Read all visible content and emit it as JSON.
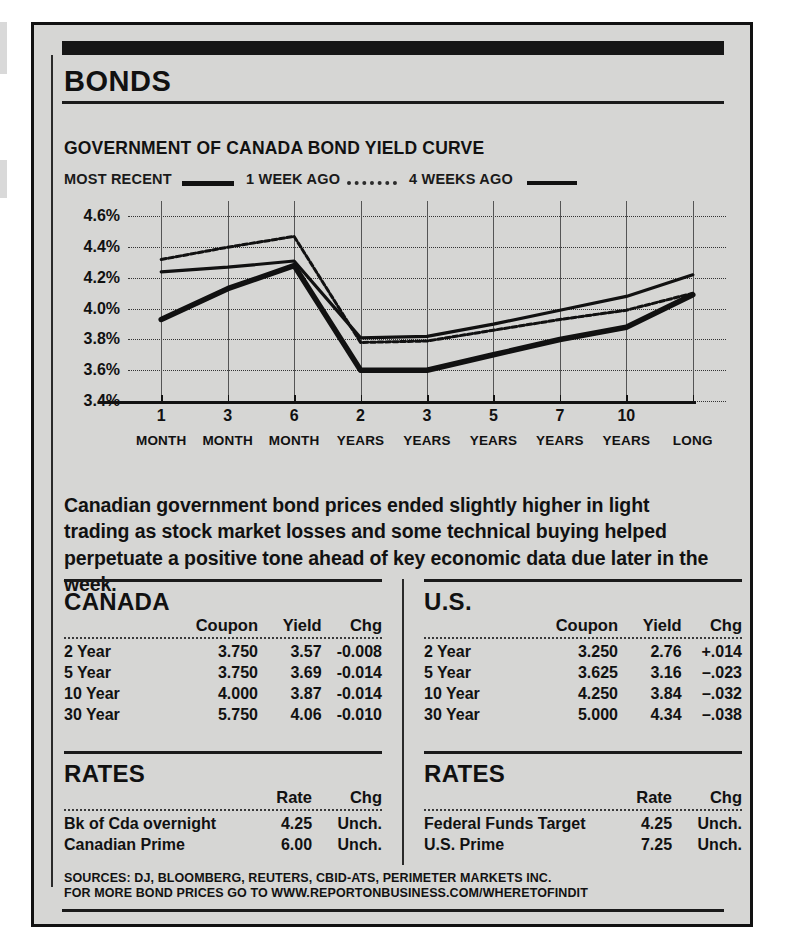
{
  "panel": {
    "title": "BONDS",
    "subtitle": "GOVERNMENT OF CANADA BOND YIELD CURVE"
  },
  "legend": [
    {
      "label": "MOST RECENT",
      "style": "solid-thick"
    },
    {
      "label": "1 WEEK AGO",
      "style": "dotted"
    },
    {
      "label": "4 WEEKS AGO",
      "style": "solid-thin"
    }
  ],
  "chart_data": {
    "type": "line",
    "title": "GOVERNMENT OF CANADA BOND YIELD CURVE",
    "xlabel": "",
    "ylabel": "",
    "ylim": [
      3.4,
      4.7
    ],
    "yticks": [
      "4.6%",
      "4.4%",
      "4.2%",
      "4.0%",
      "3.8%",
      "3.6%",
      "3.4%"
    ],
    "ytick_values": [
      4.6,
      4.4,
      4.2,
      4.0,
      3.8,
      3.6,
      3.4
    ],
    "grid": true,
    "legend_position": "top",
    "categories": [
      "1 MONTH",
      "3 MONTH",
      "6 MONTH",
      "2 YEARS",
      "3 YEARS",
      "5 YEARS",
      "7 YEARS",
      "10 YEARS",
      "LONG"
    ],
    "xtick_numbers": [
      "1",
      "3",
      "6",
      "2",
      "3",
      "5",
      "7",
      "10",
      ""
    ],
    "xtick_units": [
      "MONTH",
      "MONTH",
      "MONTH",
      "YEARS",
      "YEARS",
      "YEARS",
      "YEARS",
      "YEARS",
      "LONG"
    ],
    "series": [
      {
        "name": "MOST RECENT",
        "style": "solid-thick",
        "values": [
          3.93,
          4.13,
          4.28,
          3.6,
          3.6,
          3.7,
          3.8,
          3.88,
          4.09
        ]
      },
      {
        "name": "1 WEEK AGO",
        "style": "dotted",
        "values": [
          4.32,
          4.4,
          4.47,
          3.78,
          3.79,
          3.86,
          3.93,
          3.99,
          4.1
        ]
      },
      {
        "name": "4 WEEKS AGO",
        "style": "solid-thin",
        "values": [
          4.24,
          4.27,
          4.31,
          3.81,
          3.82,
          3.9,
          3.99,
          4.08,
          4.22
        ]
      }
    ]
  },
  "blurb": "Canadian government bond prices ended slightly higher in light trading as stock market losses and some technical buying helped perpetuate a positive tone ahead of key economic data due later in the week.",
  "canada": {
    "title": "CANADA",
    "headers": [
      "",
      "Coupon",
      "Yield",
      "Chg"
    ],
    "rows": [
      {
        "label": "2 Year",
        "coupon": "3.750",
        "yield": "3.57",
        "chg": "-0.008"
      },
      {
        "label": "5 Year",
        "coupon": "3.750",
        "yield": "3.69",
        "chg": "-0.014"
      },
      {
        "label": "10 Year",
        "coupon": "4.000",
        "yield": "3.87",
        "chg": "-0.014"
      },
      {
        "label": "30 Year",
        "coupon": "5.750",
        "yield": "4.06",
        "chg": "-0.010"
      }
    ]
  },
  "us": {
    "title": "U.S.",
    "headers": [
      "",
      "Coupon",
      "Yield",
      "Chg"
    ],
    "rows": [
      {
        "label": "2 Year",
        "coupon": "3.250",
        "yield": "2.76",
        "chg": "+.014"
      },
      {
        "label": "5 Year",
        "coupon": "3.625",
        "yield": "3.16",
        "chg": "–.023"
      },
      {
        "label": "10 Year",
        "coupon": "4.250",
        "yield": "3.84",
        "chg": "–.032"
      },
      {
        "label": "30 Year",
        "coupon": "5.000",
        "yield": "4.34",
        "chg": "–.038"
      }
    ]
  },
  "rates_canada": {
    "title": "RATES",
    "headers": [
      "",
      "Rate",
      "Chg"
    ],
    "rows": [
      {
        "label": "Bk of Cda overnight",
        "rate": "4.25",
        "chg": "Unch."
      },
      {
        "label": "Canadian Prime",
        "rate": "6.00",
        "chg": "Unch."
      }
    ]
  },
  "rates_us": {
    "title": "RATES",
    "headers": [
      "",
      "Rate",
      "Chg"
    ],
    "rows": [
      {
        "label": "Federal Funds Target",
        "rate": "4.25",
        "chg": "Unch."
      },
      {
        "label": "U.S. Prime",
        "rate": "7.25",
        "chg": "Unch."
      }
    ]
  },
  "sources": {
    "line1": "SOURCES: DJ, BLOOMBERG, REUTERS, CBID-ATS, PERIMETER MARKETS INC.",
    "line2": "FOR MORE BOND PRICES GO TO WWW.REPORTONBUSINESS.COM/WHERETOFINDIT"
  },
  "colors": {
    "ink": "#111111",
    "paper": "#d6d6d4"
  }
}
